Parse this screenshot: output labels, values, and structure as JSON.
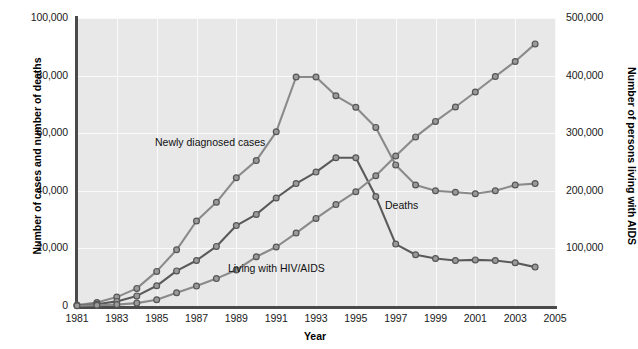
{
  "chart_data": {
    "type": "line",
    "title": "",
    "xlabel": "Year",
    "ylabel": "Number of cases and number of deaths",
    "ylabel_right": "Number of persons living with AIDS",
    "grid": true,
    "legend_position": "inline-annotations",
    "xlim": [
      1981,
      2005
    ],
    "ylim": [
      0,
      100000
    ],
    "ylim_right": [
      0,
      500000
    ],
    "xticks": [
      "1981",
      "1983",
      "1985",
      "1987",
      "1989",
      "1991",
      "1993",
      "1995",
      "1997",
      "1999",
      "2001",
      "2003",
      "2005"
    ],
    "yticks": [
      "0",
      "20,000",
      "40,000",
      "60,000",
      "80,000",
      "100,000"
    ],
    "yticks_right": [
      "0",
      "100,000",
      "200,000",
      "300,000",
      "400,000",
      "500,000"
    ],
    "x": [
      1981,
      1982,
      1983,
      1984,
      1985,
      1986,
      1987,
      1988,
      1989,
      1990,
      1991,
      1992,
      1993,
      1994,
      1995,
      1996,
      1997,
      1998,
      1999,
      2000,
      2001,
      2002,
      2003,
      2004
    ],
    "series": [
      {
        "name": "Newly diagnosed cases",
        "axis": "left",
        "color": "#8a8a8a",
        "values": [
          300,
          1200,
          3100,
          6100,
          12000,
          19500,
          29500,
          36000,
          44500,
          50500,
          60500,
          79500,
          79500,
          73000,
          69000,
          62000,
          49000,
          42000,
          40000,
          39500,
          39000,
          40000,
          42000,
          42500
        ]
      },
      {
        "name": "Deaths",
        "axis": "left",
        "color": "#5a5a5a",
        "values": [
          150,
          600,
          1600,
          3500,
          7000,
          12200,
          15800,
          20700,
          27900,
          31800,
          37500,
          42500,
          46500,
          51500,
          51500,
          38000,
          21500,
          17800,
          16500,
          15800,
          16000,
          15800,
          15000,
          13500
        ]
      },
      {
        "name": "Living with HIV/AIDS",
        "axis": "right",
        "color": "#8a8a8a",
        "values": [
          500,
          1200,
          2500,
          5000,
          11000,
          23000,
          34500,
          47500,
          62500,
          85500,
          102500,
          126500,
          152000,
          176000,
          198500,
          226000,
          260500,
          293500,
          320500,
          345500,
          371500,
          398500,
          424500,
          455000
        ]
      }
    ]
  },
  "annotations": {
    "newly": "Newly diagnosed cases",
    "deaths": "Deaths",
    "living": "Living with HIV/AIDS"
  },
  "axes": {
    "x_title": "Year",
    "y_left_title": "Number of cases and number of deaths",
    "y_right_title": "Number of persons living with AIDS"
  },
  "colors": {
    "plot_background": "#e8e8e8",
    "gridline": "#fafafa",
    "axis": "#4a4a4a",
    "series_light": "#8a8a8a",
    "series_dark": "#5a5a5a",
    "marker_fill": "#9a9a9a",
    "marker_stroke": "#555555"
  }
}
